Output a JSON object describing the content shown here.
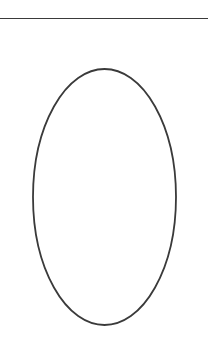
{
  "page": {
    "width": 208,
    "height": 338,
    "background_color": "#ffffff"
  },
  "figure": {
    "ink_color": "#3a3a3a",
    "elements": [
      {
        "name": "horizontal-rule",
        "type": "line",
        "x1": 0,
        "y1": 18.5,
        "x2": 208,
        "y2": 18.5,
        "stroke_width": 1.6,
        "stroke_color": "#3a3a3a"
      },
      {
        "name": "ellipse-outline",
        "type": "ellipse",
        "cx": 104.5,
        "cy": 197,
        "rx": 71.5,
        "ry": 128,
        "stroke_width": 1.8,
        "stroke_color": "#3a3a3a",
        "fill": "none",
        "bounds": {
          "left": 33,
          "top": 69,
          "right": 176,
          "bottom": 325
        }
      }
    ]
  },
  "labels": {
    "rule_label": "",
    "ellipse_label": ""
  }
}
